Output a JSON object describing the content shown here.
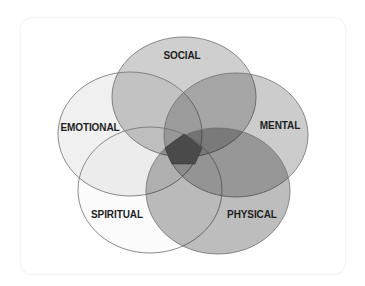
{
  "diagram": {
    "type": "venn",
    "sets": [
      {
        "id": "social",
        "label": "SOCIAL",
        "cx": 184,
        "cy": 97,
        "rx": 72,
        "ry": 60,
        "fill_opacity": 0.19,
        "label_x": 182,
        "label_y": 59
      },
      {
        "id": "emotional",
        "label": "EMOTIONAL",
        "cx": 130,
        "cy": 134,
        "rx": 72,
        "ry": 62,
        "fill_opacity": 0.06,
        "label_x": 90,
        "label_y": 131
      },
      {
        "id": "mental",
        "label": "MENTAL",
        "cx": 236,
        "cy": 135,
        "rx": 72,
        "ry": 62,
        "fill_opacity": 0.2,
        "label_x": 280,
        "label_y": 129
      },
      {
        "id": "spiritual",
        "label": "SPIRITUAL",
        "cx": 150,
        "cy": 190,
        "rx": 72,
        "ry": 63,
        "fill_opacity": 0.015,
        "label_x": 117,
        "label_y": 218
      },
      {
        "id": "physical",
        "label": "PHYSICAL",
        "cx": 218,
        "cy": 191,
        "rx": 72,
        "ry": 63,
        "fill_opacity": 0.26,
        "label_x": 252,
        "label_y": 218
      }
    ],
    "center": {
      "shape": "pentagon",
      "fill": "#4a4a4a",
      "points": "184,134 202,148 195,164 172,164 165,148"
    },
    "stroke": "#6e6e6e"
  }
}
